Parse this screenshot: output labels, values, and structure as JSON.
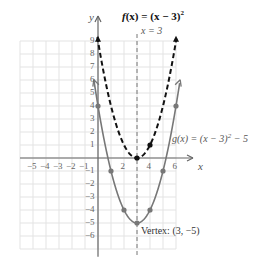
{
  "chart_data": {
    "type": "line",
    "xlabel": "x",
    "ylabel": "y",
    "xlim": [
      -6,
      7
    ],
    "ylim": [
      -7,
      10
    ],
    "grid": true,
    "x_tick_labels": [
      "−5",
      "−4",
      "−3",
      "−2",
      "−1",
      "2",
      "4",
      "6"
    ],
    "x_tick_values": [
      -5,
      -4,
      -3,
      -2,
      -1,
      2,
      4,
      6
    ],
    "y_tick_labels": [
      "9",
      "8",
      "7",
      "6",
      "5",
      "4",
      "3",
      "2",
      "1",
      "−1",
      "−2",
      "−3",
      "−4",
      "−5",
      "−6"
    ],
    "y_tick_values": [
      9,
      8,
      7,
      6,
      5,
      4,
      3,
      2,
      1,
      -1,
      -2,
      -3,
      -4,
      -5,
      -6
    ],
    "series": [
      {
        "name": "f(x) = (x − 3)²",
        "style": "dashed",
        "color": "#111111",
        "points": [
          [
            0,
            9
          ],
          [
            1,
            4
          ],
          [
            2,
            1
          ],
          [
            3,
            0
          ],
          [
            4,
            1
          ],
          [
            5,
            4
          ],
          [
            6,
            9
          ]
        ],
        "marked_points": [
          [
            0,
            9
          ],
          [
            3,
            0
          ],
          [
            4,
            1
          ],
          [
            6,
            9
          ]
        ]
      },
      {
        "name": "g(x) = (x − 3)² − 5",
        "style": "solid",
        "color": "#777777",
        "points": [
          [
            -0.3,
            5.9
          ],
          [
            0,
            4
          ],
          [
            1,
            -1
          ],
          [
            2,
            -4
          ],
          [
            3,
            -5
          ],
          [
            4,
            -4
          ],
          [
            5,
            -1
          ],
          [
            6,
            4
          ],
          [
            6.3,
            5.9
          ]
        ],
        "marked_points": [
          [
            0,
            4
          ],
          [
            1,
            -1
          ],
          [
            2,
            -4
          ],
          [
            3,
            -5
          ],
          [
            4,
            -4
          ],
          [
            5,
            -1
          ],
          [
            6,
            4
          ]
        ]
      }
    ],
    "annotations": [
      {
        "text": "x = 3",
        "type": "axis-of-symmetry",
        "x": 3
      },
      {
        "text": "g(x) = (x − 3)² − 5",
        "type": "curve-label"
      },
      {
        "text": "Vertex: (3, −5)",
        "type": "point-label",
        "x": 3,
        "y": -5
      }
    ]
  },
  "labels": {
    "title_f": "f",
    "title_rest": "(x) = (x − 3)",
    "title_exp": "2",
    "axis_sym": "x = 3",
    "g_label": "g(x) = (x − 3)",
    "g_exp": "2",
    "g_tail": " − 5",
    "vertex": "Vertex: (3, −5)",
    "x_axis": "x",
    "y_axis": "y"
  }
}
